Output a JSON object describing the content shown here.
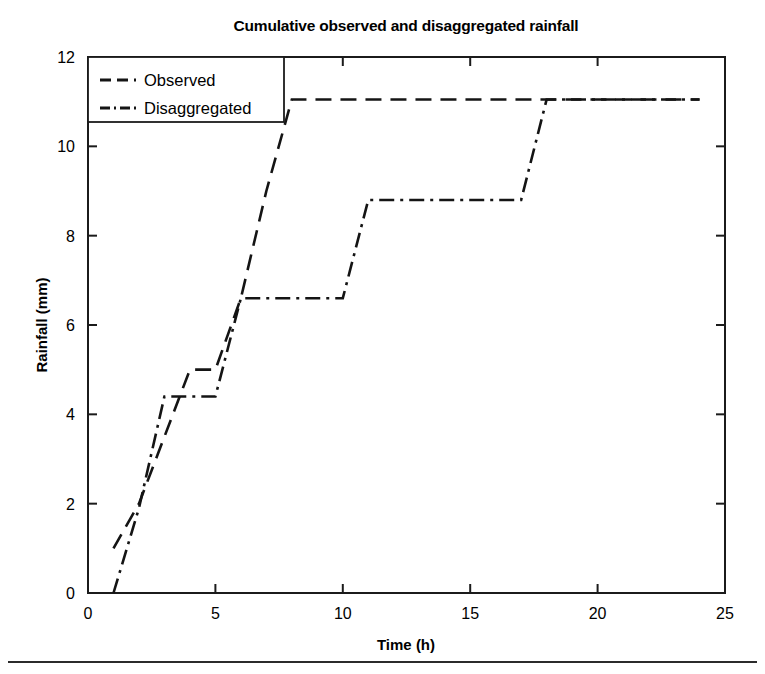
{
  "chart_data": {
    "type": "line",
    "title": "Cumulative observed and disaggregated rainfall",
    "xlabel": "Time (h)",
    "ylabel": "Rainfall (mm)",
    "xlim": [
      0,
      25
    ],
    "ylim": [
      0,
      12
    ],
    "xticks": [
      0,
      5,
      10,
      15,
      20,
      25
    ],
    "yticks": [
      0,
      2,
      4,
      6,
      8,
      10,
      12
    ],
    "xtick_labels": [
      "0",
      "5",
      "10",
      "15",
      "20",
      "25"
    ],
    "ytick_labels": [
      "0",
      "2",
      "4",
      "6",
      "8",
      "10",
      "12"
    ],
    "grid": false,
    "legend_position": "top-left",
    "series": [
      {
        "name": "Observed",
        "dash": "dashed",
        "color": "#141414",
        "x": [
          1,
          2,
          3,
          4,
          5,
          6,
          7,
          8,
          24
        ],
        "y": [
          1.0,
          2.0,
          3.5,
          5.0,
          5.0,
          6.6,
          9.0,
          11.05,
          11.05
        ]
      },
      {
        "name": "Disaggregated",
        "dash": "dash-dot",
        "color": "#141414",
        "x": [
          1,
          2,
          3,
          4,
          5,
          6,
          10,
          11,
          17,
          18,
          24
        ],
        "y": [
          0.0,
          1.9,
          4.4,
          4.4,
          4.4,
          6.6,
          6.6,
          8.8,
          8.8,
          11.05,
          11.05
        ]
      }
    ]
  },
  "legend": {
    "entries": [
      {
        "label": "Observed"
      },
      {
        "label": "Disaggregated"
      }
    ]
  },
  "figure": {
    "background_color": "#ffffff",
    "axis_color": "#1b1b1b",
    "line_color": "#141414"
  }
}
